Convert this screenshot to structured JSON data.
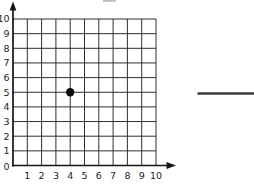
{
  "chart_data": {
    "type": "scatter",
    "title": "",
    "xlabel": "",
    "ylabel": "",
    "xlim": [
      0,
      10
    ],
    "ylim": [
      0,
      10
    ],
    "grid": true,
    "x_tick_labels": [
      "1",
      "2",
      "3",
      "4",
      "5",
      "6",
      "7",
      "8",
      "9",
      "10"
    ],
    "y_tick_labels": [
      "0",
      "1",
      "2",
      "3",
      "4",
      "5",
      "6",
      "7",
      "8",
      "9",
      "10"
    ],
    "origin_label": "0",
    "points": [
      {
        "x": 4,
        "y": 5
      }
    ]
  },
  "extras": {
    "answer_blank_line_present": true,
    "top_cropped_fragment_present": true
  },
  "colors": {
    "background": "#ffffff",
    "grid": "#2f2f2f",
    "axis": "#141414",
    "tick_label": "#1c1c1c",
    "point": "#0b0b0b",
    "answer_line": "#3b3b3b",
    "fragment": "#bfbfbf"
  }
}
